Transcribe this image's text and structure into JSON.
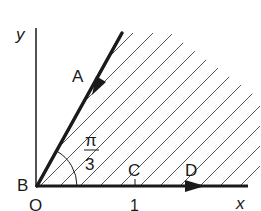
{
  "diagram": {
    "type": "region-in-complex-plane",
    "axes": {
      "x_label": "x",
      "y_label": "y",
      "origin_label": "O",
      "tick_label": "1"
    },
    "points": {
      "A": "A",
      "B": "B",
      "C": "C",
      "D": "D"
    },
    "angle": {
      "numerator": "π",
      "denominator": "3"
    },
    "colors": {
      "ink": "#1a1a1a",
      "hatch": "#555555",
      "background": "#ffffff"
    }
  }
}
